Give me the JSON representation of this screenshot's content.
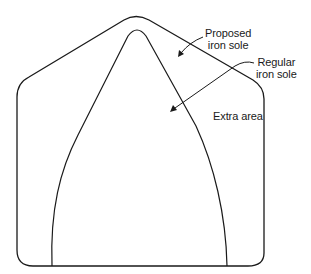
{
  "diagram": {
    "title": "",
    "shapes": [
      {
        "id": "outer",
        "name": "Proposed iron sole outline"
      },
      {
        "id": "inner",
        "name": "Regular iron sole outline"
      }
    ],
    "labels": {
      "proposed": {
        "line1": "Proposed",
        "line2": "iron sole"
      },
      "regular": {
        "line1": "Regular",
        "line2": "iron sole"
      },
      "extra": "Extra area"
    },
    "colors": {
      "stroke": "#1a1a1a",
      "background": "#ffffff"
    }
  }
}
